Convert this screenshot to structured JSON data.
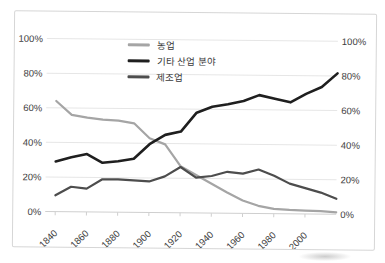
{
  "figure": {
    "background_color": "#ffffff",
    "frame_border_color": "#d6d6d6",
    "gridline_color": "#e6e6e6",
    "axis_line_color": "#cfcfcf",
    "axis_label_color": "#3d3d3d"
  },
  "chart_data": {
    "type": "line",
    "title": "",
    "xlabel": "",
    "ylabel": "",
    "xlim": [
      1840,
      2020
    ],
    "ylim": [
      0,
      100
    ],
    "grid": "horizontal",
    "legend_position": "top-center-inside",
    "y_axis_sides": "both",
    "x": [
      1840,
      1850,
      1860,
      1870,
      1880,
      1890,
      1900,
      1910,
      1920,
      1930,
      1940,
      1950,
      1960,
      1970,
      1980,
      1990,
      2000,
      2010,
      2020
    ],
    "x_ticks": [
      1840,
      1860,
      1880,
      1900,
      1920,
      1940,
      1960,
      1980,
      2000
    ],
    "x_tick_labels": [
      "1840",
      "1860",
      "1880",
      "1900",
      "1920",
      "1940",
      "1960",
      "1980",
      "2000"
    ],
    "y_ticks": [
      0,
      20,
      40,
      60,
      80,
      100
    ],
    "y_tick_labels": [
      "0%",
      "20%",
      "40%",
      "60%",
      "80%",
      "100%"
    ],
    "series": [
      {
        "name": "농업",
        "color": "#a5a5a5",
        "width": 2.2,
        "values": [
          64,
          56,
          54.5,
          53.5,
          53,
          51.5,
          43,
          39.5,
          27,
          22,
          17,
          12,
          7.5,
          4.5,
          2.8,
          2.3,
          2,
          1.8,
          1.2
        ]
      },
      {
        "name": "기타 산업 분야",
        "color": "#1f1f1f",
        "width": 2.6,
        "values": [
          29,
          31.5,
          33.5,
          28.5,
          29.5,
          31,
          39.5,
          45,
          47,
          58,
          61.5,
          63,
          65,
          68.5,
          66.5,
          64.5,
          69.5,
          73.5,
          81.5
        ]
      },
      {
        "name": "제조업",
        "color": "#4d4d4d",
        "width": 2.2,
        "values": [
          9.5,
          14.5,
          13.5,
          19,
          19,
          18.5,
          18,
          21,
          26.5,
          20.5,
          21.5,
          24,
          23,
          25.5,
          22,
          17.5,
          15,
          12.5,
          9
        ]
      }
    ]
  }
}
